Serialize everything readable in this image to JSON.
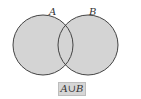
{
  "diagram": {
    "type": "venn",
    "sets": [
      {
        "label": "A",
        "cx": 43,
        "cy": 45,
        "r": 30
      },
      {
        "label": "B",
        "cx": 88,
        "cy": 45,
        "r": 30
      }
    ],
    "shaded": "union",
    "fill_color": "#d4d4d4",
    "stroke_color": "#444444",
    "caption": "A∪B"
  }
}
